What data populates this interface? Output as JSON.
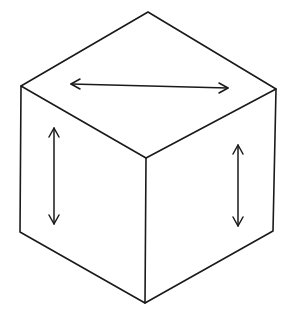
{
  "figure": {
    "title": "Isometric cube with arrows on each visible face",
    "stroke_color": "#1a1a1a",
    "background": "#ffffff",
    "cube": {
      "vertices": {
        "top": [
          148,
          12
        ],
        "upper_left": [
          21,
          86
        ],
        "upper_right": [
          276,
          89
        ],
        "center": [
          146,
          158
        ],
        "lower_left": [
          20,
          232
        ],
        "lower_right": [
          273,
          231
        ],
        "bottom": [
          145,
          303
        ]
      },
      "faces": [
        "top",
        "left",
        "right"
      ]
    },
    "arrows": [
      {
        "face": "top",
        "direction": "horizontal double-headed",
        "from": [
          71,
          84
        ],
        "to": [
          228,
          88
        ]
      },
      {
        "face": "left",
        "direction": "vertical double-headed",
        "from": [
          54,
          128
        ],
        "to": [
          54,
          224
        ]
      },
      {
        "face": "right",
        "direction": "vertical double-headed",
        "from": [
          238,
          145
        ],
        "to": [
          238,
          226
        ]
      }
    ]
  }
}
